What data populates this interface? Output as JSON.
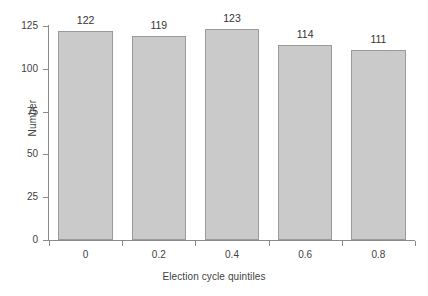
{
  "chart_data": {
    "type": "bar",
    "title": "",
    "subtitle": "",
    "xlabel": "Election cycle quintiles",
    "ylabel": "Number",
    "categories": [
      "0",
      "0.2",
      "0.4",
      "0.6",
      "0.8"
    ],
    "values": [
      122,
      119,
      123,
      114,
      111
    ],
    "value_labels": [
      "122",
      "119",
      "123",
      "114",
      "111"
    ],
    "ylim": [
      0,
      125
    ],
    "yticks": [
      0,
      25,
      50,
      75,
      100,
      125
    ],
    "ytick_labels": [
      "0",
      "25",
      "50",
      "75",
      "100",
      "125"
    ],
    "xtick_labels": [
      "0",
      "0.2",
      "0.4",
      "0.6",
      "0.8"
    ],
    "grid": false,
    "legend": false,
    "legend_position": "none",
    "bar_fill_color": "#cacaca",
    "bar_border_color": "#9a9a9a",
    "axis_color": "#8a8a8a",
    "text_color": "#3f3f3f",
    "background_color": "#ffffff"
  }
}
